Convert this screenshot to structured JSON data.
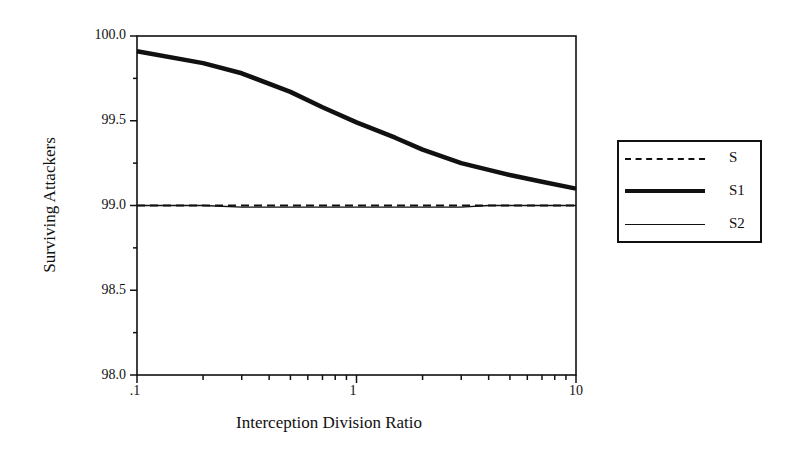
{
  "chart_data": {
    "type": "line",
    "title": "",
    "xlabel": "Interception Division Ratio",
    "ylabel": "Surviving Attackers",
    "xscale": "log",
    "xlim": [
      0.1,
      10
    ],
    "ylim": [
      98.0,
      100.0
    ],
    "x_tick_labels": [
      ".1",
      "1",
      "10"
    ],
    "y_tick_labels": [
      "100.0",
      "99.5",
      "99.0",
      "98.5",
      "98.0"
    ],
    "grid": false,
    "legend_position": "right",
    "x": [
      0.1,
      0.2,
      0.3,
      0.5,
      0.7,
      1,
      1.5,
      2,
      3,
      4,
      5,
      7,
      10
    ],
    "series": [
      {
        "name": "S",
        "style": "dashed",
        "values": [
          99.0,
          99.0,
          99.0,
          99.0,
          99.0,
          99.0,
          99.0,
          99.0,
          99.0,
          99.0,
          99.0,
          99.0,
          99.0
        ]
      },
      {
        "name": "S1",
        "style": "thick-solid",
        "values": [
          99.91,
          99.84,
          99.78,
          99.67,
          99.58,
          99.49,
          99.4,
          99.33,
          99.25,
          99.21,
          99.18,
          99.14,
          99.1
        ]
      },
      {
        "name": "S2",
        "style": "thin-solid",
        "values": [
          99.0,
          99.0,
          98.99,
          98.99,
          98.99,
          98.99,
          98.99,
          98.99,
          98.99,
          99.0,
          99.0,
          99.0,
          99.0
        ]
      }
    ]
  },
  "legend": {
    "items": [
      "S",
      "S1",
      "S2"
    ]
  }
}
